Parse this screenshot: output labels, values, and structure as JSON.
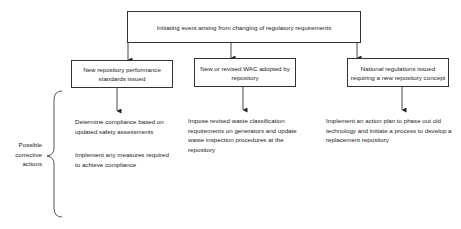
{
  "diagram": {
    "root": {
      "label": "Initiating event arising from changing of regulatory requirements"
    },
    "branches": [
      {
        "label": "New repository performance standards issued",
        "actions": [
          "Determine compliance based on updated safety assessments",
          "Implement any measures required to achieve compliance"
        ]
      },
      {
        "label": "New or revised WAC adopted by repository",
        "actions": [
          "Impose revised waste classification requirements on generators and update waste inspection procedures at the repository"
        ]
      },
      {
        "label": "National regulations issued requiring a new repository concept",
        "actions": [
          "Implement an action plan to phase out old technology and initiate a process to develop a replacement repository"
        ]
      }
    ],
    "brace_label": "Possible corrective actions",
    "colors": {
      "line": "#333333",
      "text": "#222222",
      "background": "#ffffff"
    }
  }
}
